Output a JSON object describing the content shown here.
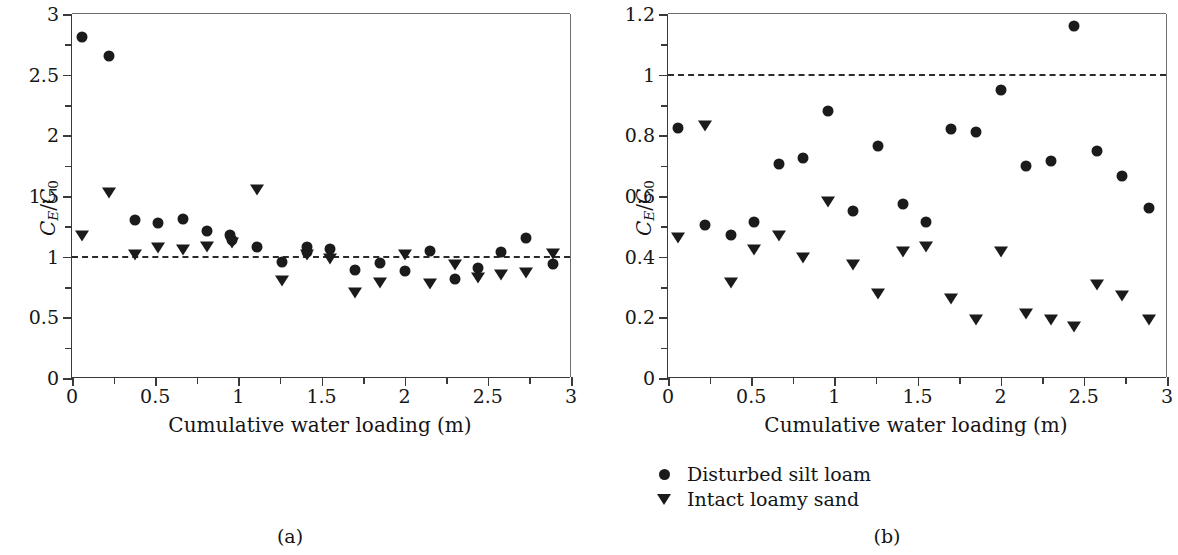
{
  "figure": {
    "background": "#ffffff",
    "marker_color": "#1b1b1b",
    "axis_color": "#3a3a3a",
    "refline_color": "#2b2b2b"
  },
  "legend": {
    "position": "below-panel-b",
    "entries": [
      {
        "marker": "circle-marker",
        "label": "Disturbed silt loam"
      },
      {
        "marker": "triangle-down-marker",
        "label": "Intact loamy sand"
      }
    ]
  },
  "captions": {
    "panel_a": "(a)",
    "panel_b": "(b)"
  },
  "chart_data": [
    {
      "id": "panel-a",
      "type": "scatter",
      "title": "",
      "caption": "(a)",
      "xlabel": "Cumulative water loading (m)",
      "ylabel": "C_E/C_0",
      "ylabel_parts": {
        "numerator_var": "C",
        "numerator_sub": "E",
        "denominator_var": "C",
        "denominator_sub": "0"
      },
      "xlim": [
        0,
        3
      ],
      "ylim": [
        0,
        3
      ],
      "xticks": [
        0,
        0.5,
        1,
        1.5,
        2,
        2.5,
        3
      ],
      "xticklabels": [
        "0",
        "0.5",
        "1",
        "1.5",
        "2",
        "2.5",
        "3"
      ],
      "xminorticks": [
        0.25,
        0.75,
        1.25,
        1.75,
        2.25,
        2.75
      ],
      "yticks": [
        0,
        0.5,
        1,
        1.5,
        2,
        2.5,
        3
      ],
      "yticklabels": [
        "0",
        "0.5",
        "1",
        "1.5",
        "2",
        "2.5",
        "3"
      ],
      "yminorticks": [
        0.25,
        0.75,
        1.25,
        1.75,
        2.25,
        2.75
      ],
      "grid": false,
      "reference_line": {
        "y": 1,
        "style": "dashed",
        "label": ""
      },
      "series": [
        {
          "name": "Disturbed silt loam",
          "marker": "circle",
          "points": [
            [
              0.06,
              2.81
            ],
            [
              0.22,
              2.65
            ],
            [
              0.38,
              1.3
            ],
            [
              0.52,
              1.28
            ],
            [
              0.67,
              1.31
            ],
            [
              0.81,
              1.21
            ],
            [
              0.95,
              1.18
            ],
            [
              0.96,
              1.14
            ],
            [
              1.11,
              1.08
            ],
            [
              1.26,
              0.96
            ],
            [
              1.41,
              1.08
            ],
            [
              1.41,
              1.04
            ],
            [
              1.55,
              1.06
            ],
            [
              1.7,
              0.89
            ],
            [
              1.85,
              0.95
            ],
            [
              2.0,
              0.88
            ],
            [
              2.15,
              1.05
            ],
            [
              2.3,
              0.82
            ],
            [
              2.44,
              0.91
            ],
            [
              2.58,
              1.04
            ],
            [
              2.73,
              1.15
            ],
            [
              2.89,
              0.94
            ]
          ]
        },
        {
          "name": "Intact loamy sand",
          "marker": "triangle",
          "points": [
            [
              0.06,
              1.18
            ],
            [
              0.22,
              1.53
            ],
            [
              0.38,
              1.02
            ],
            [
              0.52,
              1.08
            ],
            [
              0.67,
              1.06
            ],
            [
              0.81,
              1.09
            ],
            [
              0.96,
              1.12
            ],
            [
              1.11,
              1.56
            ],
            [
              1.26,
              0.81
            ],
            [
              1.41,
              1.02
            ],
            [
              1.55,
              0.99
            ],
            [
              1.7,
              0.71
            ],
            [
              1.85,
              0.79
            ],
            [
              2.0,
              1.02
            ],
            [
              2.15,
              0.78
            ],
            [
              2.3,
              0.94
            ],
            [
              2.44,
              0.83
            ],
            [
              2.58,
              0.86
            ],
            [
              2.73,
              0.87
            ],
            [
              2.89,
              1.03
            ]
          ]
        }
      ]
    },
    {
      "id": "panel-b",
      "type": "scatter",
      "title": "",
      "caption": "(b)",
      "xlabel": "Cumulative water loading (m)",
      "ylabel": "C_E/C_0",
      "ylabel_parts": {
        "numerator_var": "C",
        "numerator_sub": "E",
        "denominator_var": "C",
        "denominator_sub": "0"
      },
      "xlim": [
        0,
        3
      ],
      "ylim": [
        0,
        1.2
      ],
      "xticks": [
        0,
        0.5,
        1,
        1.5,
        2,
        2.5,
        3
      ],
      "xticklabels": [
        "0",
        "0.5",
        "1",
        "1.5",
        "2",
        "2.5",
        "3"
      ],
      "xminorticks": [
        0.25,
        0.75,
        1.25,
        1.75,
        2.25,
        2.75
      ],
      "yticks": [
        0,
        0.2,
        0.4,
        0.6,
        0.8,
        1,
        1.2
      ],
      "yticklabels": [
        "0",
        "0.2",
        "0.4",
        "0.6",
        "0.8",
        "1",
        "1.2"
      ],
      "yminorticks": [
        0.1,
        0.3,
        0.5,
        0.7,
        0.9,
        1.1
      ],
      "grid": false,
      "reference_line": {
        "y": 1,
        "style": "dashed",
        "label": ""
      },
      "series": [
        {
          "name": "Disturbed silt loam",
          "marker": "circle",
          "points": [
            [
              0.06,
              0.825
            ],
            [
              0.22,
              0.505
            ],
            [
              0.38,
              0.47
            ],
            [
              0.52,
              0.515
            ],
            [
              0.67,
              0.705
            ],
            [
              0.81,
              0.725
            ],
            [
              0.96,
              0.88
            ],
            [
              1.11,
              0.55
            ],
            [
              1.26,
              0.765
            ],
            [
              1.41,
              0.575
            ],
            [
              1.55,
              0.515
            ],
            [
              1.7,
              0.82
            ],
            [
              1.85,
              0.81
            ],
            [
              2.0,
              0.95
            ],
            [
              2.15,
              0.7
            ],
            [
              2.3,
              0.715
            ],
            [
              2.44,
              1.16
            ],
            [
              2.58,
              0.75
            ],
            [
              2.73,
              0.665
            ],
            [
              2.89,
              0.56
            ]
          ]
        },
        {
          "name": "Intact loamy sand",
          "marker": "triangle",
          "points": [
            [
              0.06,
              0.465
            ],
            [
              0.22,
              0.835
            ],
            [
              0.38,
              0.315
            ],
            [
              0.52,
              0.425
            ],
            [
              0.67,
              0.47
            ],
            [
              0.81,
              0.4
            ],
            [
              0.96,
              0.585
            ],
            [
              1.11,
              0.375
            ],
            [
              1.26,
              0.28
            ],
            [
              1.41,
              0.42
            ],
            [
              1.55,
              0.435
            ],
            [
              1.7,
              0.265
            ],
            [
              1.85,
              0.195
            ],
            [
              2.0,
              0.42
            ],
            [
              2.15,
              0.215
            ],
            [
              2.3,
              0.195
            ],
            [
              2.44,
              0.17
            ],
            [
              2.58,
              0.31
            ],
            [
              2.73,
              0.275
            ],
            [
              2.89,
              0.195
            ]
          ]
        }
      ]
    }
  ],
  "panels": [
    {
      "name": "panel-a",
      "box": {
        "left": 71,
        "top": 14,
        "width": 499,
        "height": 364
      },
      "xlabel_pos": {
        "x": 320,
        "y": 413
      },
      "ylabel_pos": {
        "x": 20,
        "y": 196
      },
      "caption_pos": {
        "x": 290,
        "y": 525
      }
    },
    {
      "name": "panel-b",
      "box": {
        "left": 78,
        "top": 14,
        "width": 499,
        "height": 364
      },
      "xlabel_pos": {
        "x": 327,
        "y": 413
      },
      "ylabel_pos": {
        "x": 27,
        "y": 196
      },
      "caption_pos": {
        "x": 887,
        "y": 525
      }
    }
  ]
}
